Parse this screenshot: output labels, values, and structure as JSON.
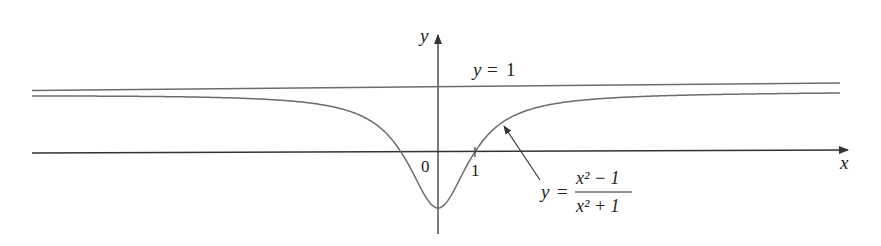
{
  "figure": {
    "axis_labels": {
      "x": "x",
      "y": "y"
    },
    "tick_labels": {
      "origin": "0",
      "x_one": "1"
    },
    "asymptote": {
      "label": "y = 1",
      "label_lhs": "y",
      "label_eq": "=",
      "label_rhs": "1",
      "value": 1
    },
    "function": {
      "label_lhs": "y",
      "label_eq": "=",
      "numerator": "x² − 1",
      "denominator": "x² + 1",
      "expression": "y = (x^2 - 1)/(x^2 + 1)"
    },
    "colors": {
      "axis": "#333333",
      "curve": "#6b6b6b",
      "asymptote": "#6b6b6b",
      "text": "#222222"
    }
  },
  "chart_data": {
    "type": "line",
    "title": "",
    "xlabel": "x",
    "ylabel": "y",
    "series": [
      {
        "name": "y = (x^2 - 1)/(x^2 + 1)",
        "x": [
          -11,
          -8,
          -6,
          -4,
          -3,
          -2,
          -1.5,
          -1,
          -0.5,
          0,
          0.5,
          1,
          1.5,
          2,
          3,
          4,
          6,
          8,
          11
        ],
        "values": [
          0.9836,
          0.9692,
          0.9459,
          0.8824,
          0.8,
          0.6,
          0.3846,
          0,
          -0.6,
          -1,
          -0.6,
          0,
          0.3846,
          0.6,
          0.8,
          0.8824,
          0.9459,
          0.9692,
          0.9836
        ]
      },
      {
        "name": "y = 1 (horizontal asymptote)",
        "x": [
          -11,
          11
        ],
        "values": [
          1,
          1
        ]
      }
    ],
    "annotations": [
      "0",
      "1",
      "y = 1",
      "y = (x^2 - 1)/(x^2 + 1)"
    ],
    "xlim": [
      -11,
      12
    ],
    "ylim": [
      -1.4,
      1.4
    ],
    "grid": false,
    "legend": "none"
  }
}
